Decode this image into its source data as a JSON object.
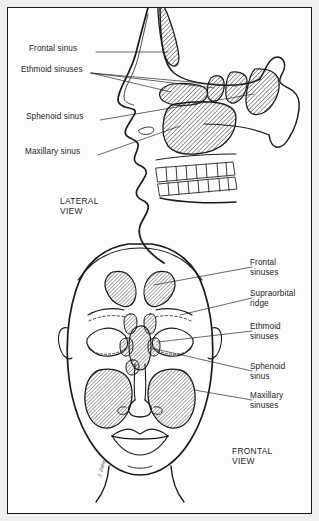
{
  "figure": {
    "background_color": "#fdfdfd",
    "line_color": "#1a1a1a",
    "hatch_color": "#3a3a3a",
    "text_color": "#1c1c1c",
    "signature": "J. Zeiler"
  },
  "lateral": {
    "view_caption": "LATERAL\nVIEW",
    "labels": [
      {
        "text": "Frontal sinus",
        "x": 28,
        "y": 40
      },
      {
        "text": "Ethmoid sinuses",
        "x": 20,
        "y": 61
      },
      {
        "text": "Sphenoid sinus",
        "x": 25,
        "y": 108
      },
      {
        "text": "Maxillary sinus",
        "x": 24,
        "y": 143
      }
    ]
  },
  "frontal": {
    "view_caption": "FRONTAL\nVIEW",
    "labels": [
      {
        "text": "Frontal\nsinuses",
        "x": 249,
        "y": 254
      },
      {
        "text": "Supraorbital\nridge",
        "x": 249,
        "y": 285
      },
      {
        "text": "Ethmoid\nsinuses",
        "x": 249,
        "y": 318
      },
      {
        "text": "Sphenoid\nsinus",
        "x": 249,
        "y": 358
      },
      {
        "text": "Maxillary\nsinuses",
        "x": 249,
        "y": 387
      }
    ]
  }
}
